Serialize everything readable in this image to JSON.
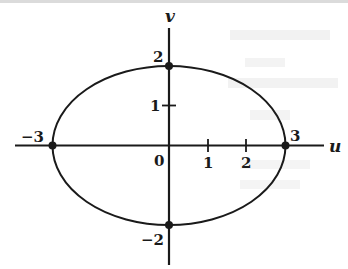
{
  "diagram": {
    "type": "ellipse-plot",
    "equation_implied": "u^2/9 + v^2/4 = 1",
    "axes": {
      "horizontal": {
        "label": "u",
        "ticks": [
          "1",
          "2"
        ]
      },
      "vertical": {
        "label": "v",
        "ticks": [
          "1"
        ]
      },
      "origin_label": "0"
    },
    "points": [
      {
        "name": "left-intercept",
        "u": -3,
        "v": 0,
        "label": "−3"
      },
      {
        "name": "right-intercept",
        "u": 3,
        "v": 0,
        "label": "3"
      },
      {
        "name": "top-intercept",
        "u": 0,
        "v": 2,
        "label": "2"
      },
      {
        "name": "bottom-intercept",
        "u": 0,
        "v": -2,
        "label": "−2"
      }
    ],
    "colors": {
      "stroke": "#1a1a1a",
      "background": "#ffffff",
      "bleed_text": "#e9e9e9"
    }
  }
}
